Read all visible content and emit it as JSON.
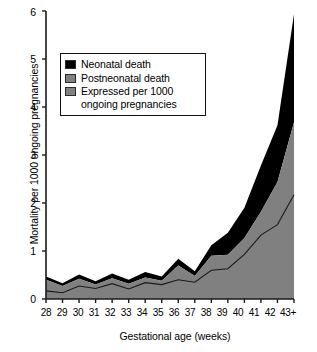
{
  "chart_data": {
    "type": "area",
    "title": "",
    "xlabel": "Gestational age (weeks)",
    "ylabel": "Mortality per 1000 ongoing pregnancies",
    "categories": [
      "28",
      "29",
      "30",
      "31",
      "32",
      "33",
      "34",
      "35",
      "36",
      "37",
      "38",
      "39",
      "40",
      "41",
      "42",
      "43+"
    ],
    "xlim": [
      0,
      15
    ],
    "ylim": [
      0,
      6
    ],
    "yticks": [
      "0",
      "1",
      "2",
      "3",
      "4",
      "5",
      "6"
    ],
    "grid": false,
    "legend_position": "upper-left-inside",
    "series": [
      {
        "name": "Neonatal death",
        "color": "#000000",
        "note": "top band of stacked area; values are cumulative totals at top of black band",
        "cumulative_top": [
          0.47,
          0.33,
          0.51,
          0.37,
          0.53,
          0.4,
          0.56,
          0.47,
          0.84,
          0.58,
          1.12,
          1.38,
          1.9,
          2.78,
          3.62,
          5.93
        ]
      },
      {
        "name": "Postneonatal death",
        "color": "#808080",
        "note": "lower band of stacked area; values are top of gray band",
        "cumulative_top": [
          0.4,
          0.27,
          0.42,
          0.3,
          0.43,
          0.32,
          0.45,
          0.38,
          0.7,
          0.48,
          0.9,
          0.92,
          1.27,
          1.82,
          2.44,
          3.68
        ]
      },
      {
        "name": "Expressed per 1000 ongoing pregnancies",
        "color": "#808080",
        "note": "thin dark line overlaid on the gray band",
        "values": [
          0.17,
          0.13,
          0.27,
          0.22,
          0.32,
          0.21,
          0.34,
          0.3,
          0.4,
          0.35,
          0.6,
          0.63,
          0.93,
          1.33,
          1.55,
          2.17
        ]
      }
    ]
  },
  "axes": {
    "ylabel": "Mortality per 1000 ongoing pregnancies",
    "xlabel": "Gestational age (weeks)",
    "yticks": [
      "6",
      "5",
      "4",
      "3",
      "2",
      "1",
      "0"
    ],
    "xticks": [
      "28",
      "29",
      "30",
      "31",
      "32",
      "33",
      "34",
      "35",
      "36",
      "37",
      "38",
      "39",
      "40",
      "41",
      "42",
      "43+"
    ]
  },
  "legend": {
    "items": [
      {
        "label": "Neonatal death",
        "swatch": "black"
      },
      {
        "label": "Postneonatal death",
        "swatch": "gray"
      },
      {
        "label": "Expressed per 1000\nongoing pregnancies",
        "swatch": "gray"
      }
    ]
  },
  "colors": {
    "neonatal": "#000000",
    "postneonatal": "#808080",
    "axis": "#1a1a1a",
    "background": "#ffffff"
  }
}
